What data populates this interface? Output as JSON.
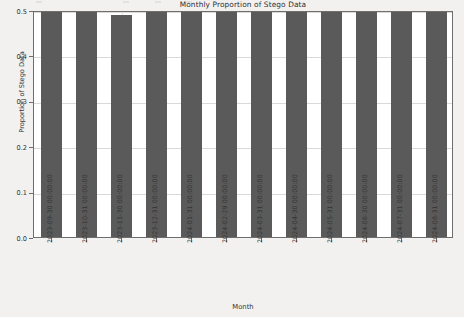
{
  "chart_data": {
    "type": "bar",
    "title": "Monthly Proportion of Stego Data",
    "xlabel": "Month",
    "ylabel": "Proportion of Stego Data",
    "grid": true,
    "legend": null,
    "ylim": [
      0.0,
      0.5
    ],
    "ytick_labels": [
      "0.0",
      "0.1",
      "0.2",
      "0.3",
      "0.4",
      "0.5"
    ],
    "ytick_values": [
      0.0,
      0.1,
      0.2,
      0.3,
      0.4,
      0.5
    ],
    "bar_color": "#5a5a5a",
    "categories": [
      "2023-09-30 00:00:00",
      "2023-10-31 00:00:00",
      "2023-11-30 00:00:00",
      "2023-12-31 00:00:00",
      "2024-01-31 00:00:00",
      "2024-02-29 00:00:00",
      "2024-03-31 00:00:00",
      "2024-04-30 00:00:00",
      "2024-05-31 00:00:00",
      "2024-06-30 00:00:00",
      "2024-07-31 00:00:00",
      "2024-08-31 00:00:00"
    ],
    "values": [
      0.5,
      0.502,
      0.49,
      0.508,
      0.503,
      0.499,
      0.5,
      0.5,
      0.505,
      0.5,
      0.513,
      0.514
    ]
  }
}
